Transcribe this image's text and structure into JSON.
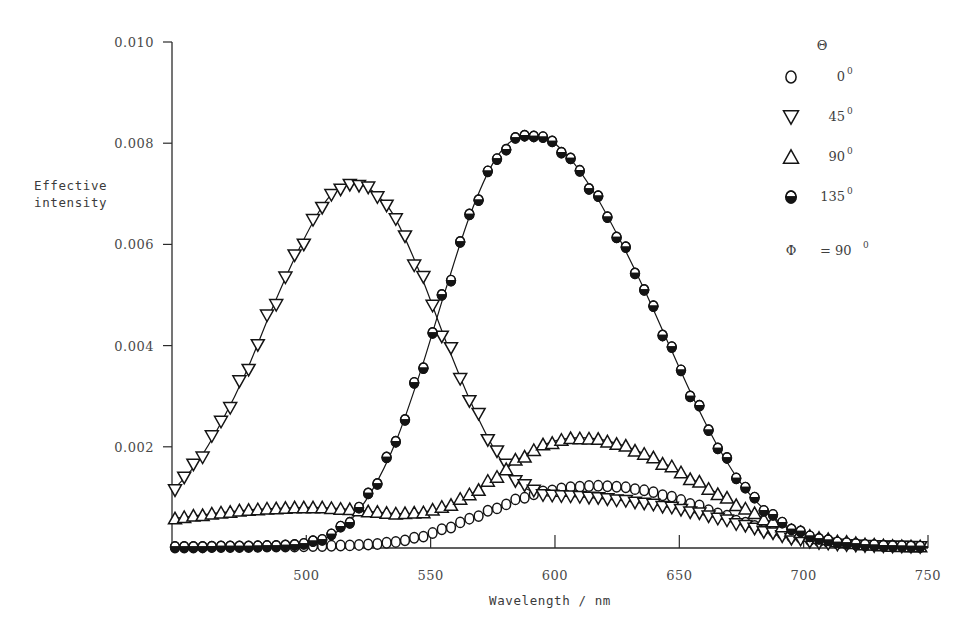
{
  "chart_data": {
    "type": "line",
    "title": "",
    "xlabel": "Wavelength / nm",
    "ylabel": "Effective intensity",
    "ylabel_line1": "Effective",
    "ylabel_line2": "intensity",
    "xlim": [
      446,
      750
    ],
    "ylim": [
      0,
      0.01
    ],
    "grid": false,
    "xticks": [
      500,
      550,
      600,
      650,
      700,
      750
    ],
    "xtick_labels": [
      "500",
      "550",
      "600",
      "650",
      "700",
      "750"
    ],
    "yticks": [
      0.002,
      0.004,
      0.006,
      0.008,
      0.01
    ],
    "ytick_labels": [
      "0.002",
      "0.004",
      "0.006",
      "0.008",
      "0.010"
    ],
    "legend_position": "top-right",
    "legend_title": "Θ",
    "legend_annotation_symbol": "Φ",
    "legend_annotation_text": "= 90",
    "legend_annotation_sup": "0",
    "series": [
      {
        "name": "0",
        "name_sup": "0",
        "marker": "open-circle",
        "x": [
          446,
          456,
          466,
          476,
          486,
          496,
          506,
          516,
          526,
          536,
          546,
          556,
          566,
          576,
          586,
          596,
          606,
          616,
          626,
          636,
          646,
          656,
          666,
          676,
          686,
          696,
          706,
          716,
          726,
          736,
          746,
          750
        ],
        "y": [
          1e-05,
          1e-05,
          2e-05,
          2e-05,
          3e-05,
          3e-05,
          4e-05,
          5e-05,
          7e-05,
          0.00012,
          0.00022,
          0.00038,
          0.00058,
          0.00078,
          0.00098,
          0.00112,
          0.0012,
          0.00123,
          0.00121,
          0.00114,
          0.00102,
          0.00086,
          0.00068,
          0.0005,
          0.00034,
          0.00022,
          0.00013,
          8e-05,
          5e-05,
          3e-05,
          2e-05,
          2e-05
        ]
      },
      {
        "name": "45",
        "name_sup": "0",
        "marker": "open-down-triangle",
        "x": [
          446,
          456,
          466,
          476,
          486,
          496,
          506,
          512,
          518,
          524,
          530,
          536,
          546,
          556,
          566,
          576,
          586,
          596,
          606,
          616,
          626,
          636,
          646,
          656,
          666,
          676,
          686,
          696,
          706,
          716,
          726,
          736,
          746,
          750
        ],
        "y": [
          0.00112,
          0.00168,
          0.0025,
          0.0035,
          0.0047,
          0.0058,
          0.00672,
          0.00706,
          0.00718,
          0.00714,
          0.0069,
          0.0065,
          0.0054,
          0.0041,
          0.0029,
          0.00192,
          0.00126,
          0.00104,
          0.00102,
          0.00099,
          0.00094,
          0.00088,
          0.0008,
          0.0007,
          0.00058,
          0.00044,
          0.0003,
          0.00018,
          0.0001,
          6e-05,
          4e-05,
          3e-05,
          2e-05,
          2e-05
        ]
      },
      {
        "name": "90",
        "name_sup": "0",
        "marker": "open-up-triangle",
        "x": [
          446,
          456,
          466,
          476,
          486,
          496,
          506,
          516,
          526,
          536,
          546,
          556,
          566,
          576,
          586,
          596,
          606,
          616,
          626,
          636,
          646,
          656,
          666,
          676,
          686,
          696,
          706,
          716,
          726,
          736,
          746,
          750
        ],
        "y": [
          0.00058,
          0.00064,
          0.0007,
          0.00075,
          0.00078,
          0.0008,
          0.0008,
          0.00077,
          0.00072,
          0.00068,
          0.0007,
          0.00082,
          0.00106,
          0.0014,
          0.00178,
          0.00205,
          0.00217,
          0.00216,
          0.00205,
          0.00186,
          0.00162,
          0.00134,
          0.00106,
          0.00078,
          0.00054,
          0.00034,
          0.0002,
          0.00012,
          7e-05,
          4e-05,
          3e-05,
          2e-05
        ]
      },
      {
        "name": "135",
        "name_sup": "0",
        "marker": "half-filled-circle",
        "x": [
          446,
          456,
          466,
          476,
          486,
          496,
          506,
          516,
          526,
          536,
          546,
          556,
          566,
          576,
          586,
          596,
          606,
          616,
          626,
          636,
          646,
          656,
          666,
          676,
          686,
          696,
          706,
          716,
          726,
          736,
          746,
          750
        ],
        "y": [
          2e-05,
          2e-05,
          3e-05,
          3e-05,
          4e-05,
          6e-05,
          0.00016,
          0.00046,
          0.0011,
          0.0021,
          0.0035,
          0.0051,
          0.0066,
          0.00768,
          0.00815,
          0.00812,
          0.0077,
          0.007,
          0.0061,
          0.0051,
          0.004,
          0.00292,
          0.00196,
          0.0012,
          0.00068,
          0.00036,
          0.00018,
          0.0001,
          6e-05,
          4e-05,
          3e-05,
          2e-05
        ]
      }
    ]
  }
}
